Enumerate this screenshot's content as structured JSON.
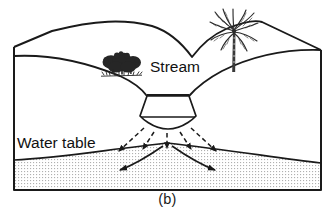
{
  "figure": {
    "caption": "(b)",
    "type": "block-diagram"
  },
  "labels": {
    "stream": "Stream",
    "water_table": "Water table"
  },
  "colors": {
    "outline": "#1a1a1a",
    "stipple_dot": "#b4b4b4",
    "saturated_fill": "#ffffff",
    "vegetation": "#262626",
    "background": "#ffffff"
  },
  "features": {
    "vegetation": [
      {
        "name": "shrub-cluster",
        "side": "left-ridge"
      },
      {
        "name": "palm-tree",
        "side": "right-ridge"
      }
    ],
    "seepage_arrows": {
      "style": "dashed",
      "count": 5,
      "direction": "downward-radiating",
      "meaning": "stream water percolating down to water table"
    },
    "groundwater_arrows": {
      "style": "solid-curved",
      "count": 2,
      "direction": "outward-lateral",
      "meaning": "groundwater flow away from recharge mound"
    },
    "water_table": {
      "shape": "mound beneath stream",
      "zone_below": "saturated zone (stippled)"
    },
    "stream_channel": {
      "shape": "trapezoid",
      "water_surface": "horizontal line"
    }
  }
}
